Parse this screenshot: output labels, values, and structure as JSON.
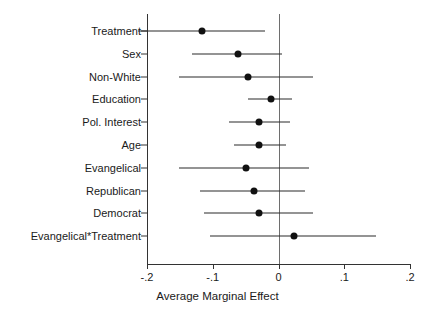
{
  "chart_data": {
    "type": "scatter",
    "title": "",
    "xlabel": "Average Marginal Effect",
    "ylabel": "",
    "xlim": [
      -0.225,
      0.225
    ],
    "xticks": [
      -0.2,
      -0.1,
      0,
      0.1,
      0.2
    ],
    "xticklabels": [
      "-.2",
      "-.1",
      "0",
      ".1",
      ".2"
    ],
    "grid": false,
    "legend": null,
    "reference_line": 0,
    "categories": [
      "Treatment",
      "Sex",
      "Non-White",
      "Education",
      "Pol. Interest",
      "Age",
      "Evangelical",
      "Republican",
      "Democrat",
      "Evangelical*Treatment"
    ],
    "values": [
      -0.116,
      -0.061,
      -0.047,
      -0.012,
      -0.029,
      -0.029,
      -0.05,
      -0.037,
      -0.029,
      0.023
    ],
    "ci_low": [
      -0.213,
      -0.131,
      -0.152,
      -0.046,
      -0.076,
      -0.068,
      -0.152,
      -0.119,
      -0.113,
      -0.104
    ],
    "ci_high": [
      -0.02,
      0.005,
      0.052,
      0.021,
      0.018,
      0.011,
      0.047,
      0.041,
      0.053,
      0.148
    ],
    "points": [
      {
        "label": "Treatment",
        "estimate": -0.116,
        "ci_low": -0.213,
        "ci_high": -0.02
      },
      {
        "label": "Sex",
        "estimate": -0.061,
        "ci_low": -0.131,
        "ci_high": 0.005
      },
      {
        "label": "Non-White",
        "estimate": -0.047,
        "ci_low": -0.152,
        "ci_high": 0.052
      },
      {
        "label": "Education",
        "estimate": -0.012,
        "ci_low": -0.046,
        "ci_high": 0.021
      },
      {
        "label": "Pol. Interest",
        "estimate": -0.029,
        "ci_low": -0.076,
        "ci_high": 0.018
      },
      {
        "label": "Age",
        "estimate": -0.029,
        "ci_low": -0.068,
        "ci_high": 0.011
      },
      {
        "label": "Evangelical",
        "estimate": -0.05,
        "ci_low": -0.152,
        "ci_high": 0.047
      },
      {
        "label": "Republican",
        "estimate": -0.037,
        "ci_low": -0.119,
        "ci_high": 0.041
      },
      {
        "label": "Democrat",
        "estimate": -0.029,
        "ci_low": -0.113,
        "ci_high": 0.053
      },
      {
        "label": "Evangelical*Treatment",
        "estimate": 0.023,
        "ci_low": -0.104,
        "ci_high": 0.148
      }
    ],
    "colors": {
      "point": "#111111",
      "line": "#2b2b2b",
      "axis": "#333333",
      "reference": "#6e6e6e",
      "background": "#ffffff",
      "text": "#1a1a1a"
    }
  }
}
